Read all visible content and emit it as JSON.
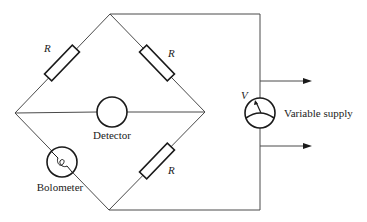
{
  "diagram": {
    "labels": {
      "resistor_top_left": "R",
      "resistor_top_right": "R",
      "resistor_bottom_right": "R",
      "detector": "Detector",
      "bolometer": "Bolometer",
      "voltage": "V",
      "supply": "Variable supply"
    },
    "components": [
      {
        "id": "resistor-top-left",
        "type": "resistor",
        "label": "R"
      },
      {
        "id": "resistor-top-right",
        "type": "resistor",
        "label": "R"
      },
      {
        "id": "resistor-bottom-right",
        "type": "resistor",
        "label": "R"
      },
      {
        "id": "bolometer",
        "type": "bolometer",
        "label": "Bolometer"
      },
      {
        "id": "detector",
        "type": "detector",
        "label": "Detector"
      },
      {
        "id": "variable-supply",
        "type": "meter-source",
        "label": "Variable supply",
        "symbol": "V"
      }
    ],
    "colors": {
      "line": "#4a4a4a",
      "component": "#1a1a1a",
      "background": "#ffffff"
    }
  }
}
